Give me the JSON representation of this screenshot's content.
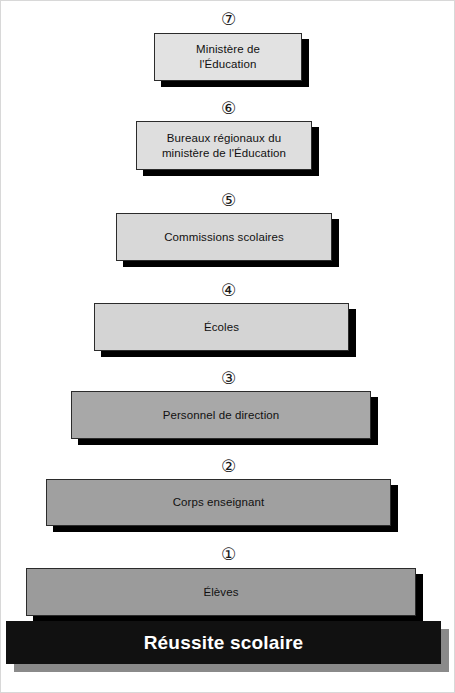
{
  "figure": {
    "base": {
      "label": "Réussite scolaire",
      "color": "#111111",
      "text_color": "#ffffff"
    },
    "tiers": [
      {
        "number": "⑦",
        "number_plain": "7",
        "label": "Ministère de\nl'Éducation",
        "fill": "#e2e2e2"
      },
      {
        "number": "⑥",
        "number_plain": "6",
        "label": "Bureaux régionaux du\nministère de l'Éducation",
        "fill": "#dedede"
      },
      {
        "number": "⑤",
        "number_plain": "5",
        "label": "Commissions scolaires",
        "fill": "#d8d8d8"
      },
      {
        "number": "④",
        "number_plain": "4",
        "label": "Écoles",
        "fill": "#d4d4d4"
      },
      {
        "number": "③",
        "number_plain": "3",
        "label": "Personnel de direction",
        "fill": "#a8a8a8"
      },
      {
        "number": "②",
        "number_plain": "2",
        "label": "Corps enseignant",
        "fill": "#a0a0a0"
      },
      {
        "number": "①",
        "number_plain": "1",
        "label": "Élèves",
        "fill": "#9b9b9b"
      }
    ]
  }
}
